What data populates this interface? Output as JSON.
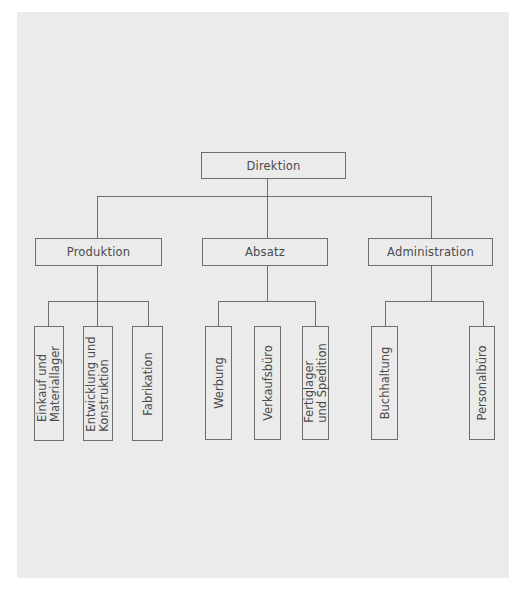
{
  "diagram": {
    "type": "org-chart",
    "root": {
      "label": "Direktion"
    },
    "departments": [
      {
        "label": "Produktion",
        "units": [
          {
            "lines": [
              "Einkauf und",
              "Materiallager"
            ]
          },
          {
            "lines": [
              "Entwicklung und",
              "Konstruktion"
            ]
          },
          {
            "lines": [
              "Fabrikation"
            ]
          }
        ]
      },
      {
        "label": "Absatz",
        "units": [
          {
            "lines": [
              "Werbung"
            ]
          },
          {
            "lines": [
              "Verkaufsbüro"
            ]
          },
          {
            "lines": [
              "Fertiglager",
              "und Spedition"
            ]
          }
        ]
      },
      {
        "label": "Administration",
        "units": [
          {
            "lines": [
              "Buchhaltung"
            ]
          },
          {
            "lines": [
              "Personalbüro"
            ]
          }
        ]
      }
    ],
    "colors": {
      "background": "#ebebeb",
      "line": "#6e6e6e",
      "text": "#4a4a4a"
    }
  }
}
